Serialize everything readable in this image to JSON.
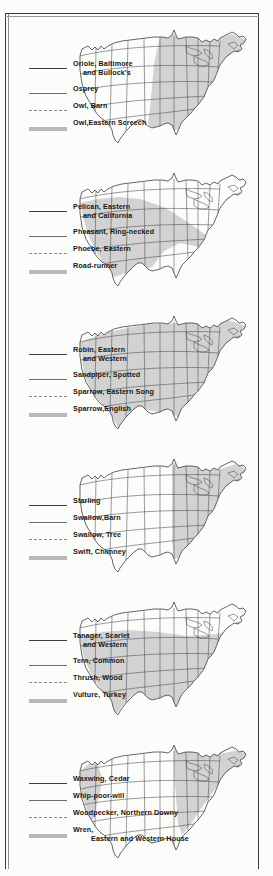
{
  "page": {
    "panel_count": 6,
    "map_type": "united-states-range-map",
    "line_styles": [
      "solid-thin",
      "solid-medium",
      "dashed",
      "thick-gray"
    ],
    "shade_color": "#d2d2d2",
    "outline_color": "#4a4a4a",
    "rule_color": "#3a3a3a"
  },
  "panels": [
    {
      "id": "panel-1",
      "range_shape": "east-central",
      "legend": [
        {
          "style": "solid-thin",
          "line1": "Oriole, Baltimore",
          "line2": "and Bullock's",
          "indent": "indent2"
        },
        {
          "style": "solid-med",
          "line1": "Osprey",
          "line2": "",
          "indent": ""
        },
        {
          "style": "dash",
          "line1": "Owl, Barn",
          "line2": "",
          "indent": ""
        },
        {
          "style": "thick",
          "line1": "Owl,Eastern Screech",
          "line2": "",
          "indent": ""
        }
      ]
    },
    {
      "id": "panel-2",
      "range_shape": "southwest",
      "legend": [
        {
          "style": "solid-thin",
          "line1": "Pelican, Eastern",
          "line2": "and California",
          "indent": "indent2"
        },
        {
          "style": "solid-med",
          "line1": "Pheasant, Ring-necked",
          "line2": "",
          "indent": ""
        },
        {
          "style": "dash",
          "line1": "Phoebe, Eastern",
          "line2": "",
          "indent": ""
        },
        {
          "style": "thick",
          "line1": "Road-runner",
          "line2": "",
          "indent": ""
        }
      ]
    },
    {
      "id": "panel-3",
      "range_shape": "nationwide",
      "legend": [
        {
          "style": "solid-thin",
          "line1": "Robin, Eastern",
          "line2": "and Western",
          "indent": "indent2"
        },
        {
          "style": "solid-med",
          "line1": "Sandpiper, Spotted",
          "line2": "",
          "indent": ""
        },
        {
          "style": "dash",
          "line1": "Sparrow, Eastern Song",
          "line2": "",
          "indent": ""
        },
        {
          "style": "thick",
          "line1": "Sparrow,English",
          "line2": "",
          "indent": ""
        }
      ]
    },
    {
      "id": "panel-4",
      "range_shape": "east-northeast",
      "legend": [
        {
          "style": "solid-thin",
          "line1": "Starling",
          "line2": "",
          "indent": ""
        },
        {
          "style": "solid-med",
          "line1": "Swallow,Barn",
          "line2": "",
          "indent": ""
        },
        {
          "style": "dash",
          "line1": "Swallow, Tree",
          "line2": "",
          "indent": ""
        },
        {
          "style": "thick",
          "line1": "Swift, Chimney",
          "line2": "",
          "indent": ""
        }
      ]
    },
    {
      "id": "panel-5",
      "range_shape": "southern-band",
      "legend": [
        {
          "style": "solid-thin",
          "line1": "Tanager, Scarlet",
          "line2": "and Western",
          "indent": "indent2"
        },
        {
          "style": "solid-med",
          "line1": "Tern, Common",
          "line2": "",
          "indent": ""
        },
        {
          "style": "dash",
          "line1": "Thrush, Wood",
          "line2": "",
          "indent": ""
        },
        {
          "style": "thick",
          "line1": "Vulture, Turkey",
          "line2": "",
          "indent": ""
        }
      ]
    },
    {
      "id": "panel-6",
      "range_shape": "northeast-and-west-coast",
      "legend": [
        {
          "style": "solid-thin",
          "line1": "Waxwing, Cedar",
          "line2": "",
          "indent": ""
        },
        {
          "style": "solid-med",
          "line1": "Whip-poor-will",
          "line2": "",
          "indent": ""
        },
        {
          "style": "dash",
          "line1": "Woodpecker, Northern Downy",
          "line2": "",
          "indent": ""
        },
        {
          "style": "thick",
          "line1": "Wren,",
          "line2": "Eastern and Western House",
          "indent": "indent3"
        }
      ]
    }
  ]
}
